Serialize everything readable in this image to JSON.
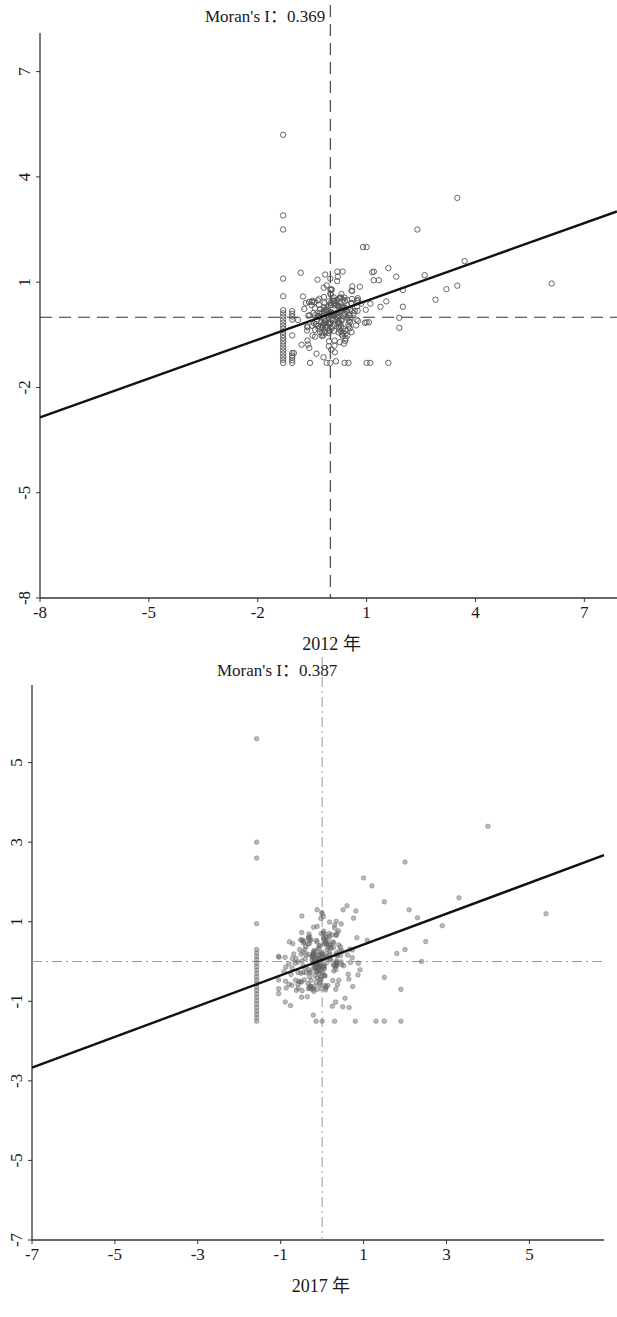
{
  "chart_data": [
    {
      "type": "scatter",
      "title": "Moran's I：0.369",
      "xlabel": "2012 年",
      "ylabel": "",
      "xlim": [
        -8,
        7.9
      ],
      "ylim": [
        -8,
        8.1
      ],
      "xticks": [
        -8,
        -5,
        -2,
        1,
        4,
        7
      ],
      "yticks": [
        -8,
        -5,
        -2,
        1,
        4,
        7
      ],
      "xtick_labels": [
        "-8",
        "-5",
        "-2",
        "1",
        "4",
        "7"
      ],
      "ytick_labels": [
        "-8",
        "-5",
        "-2",
        "1",
        "4",
        "7"
      ],
      "grid": false,
      "reference_lines": {
        "x": 0,
        "y": 0,
        "style": "dashed"
      },
      "fit_line": {
        "slope": 0.369,
        "intercept": 0.1
      },
      "marker": "hollow-circle",
      "marker_color": "#555555",
      "highlighted_points": [
        {
          "x": -1.3,
          "y": 5.2
        },
        {
          "x": -1.3,
          "y": 2.9
        },
        {
          "x": -1.3,
          "y": 2.5
        },
        {
          "x": -1.3,
          "y": 1.1
        },
        {
          "x": -1.3,
          "y": 0.6
        },
        {
          "x": 3.5,
          "y": 3.4
        },
        {
          "x": 2.4,
          "y": 2.5
        },
        {
          "x": 6.1,
          "y": 0.96
        },
        {
          "x": 0.9,
          "y": 2.0
        },
        {
          "x": 1.0,
          "y": 2.0
        },
        {
          "x": 0.0,
          "y": 1.1
        },
        {
          "x": 2.6,
          "y": 1.2
        },
        {
          "x": 3.2,
          "y": 0.8
        },
        {
          "x": 3.7,
          "y": 1.6
        },
        {
          "x": 2.9,
          "y": 0.5
        },
        {
          "x": 3.5,
          "y": 0.9
        },
        {
          "x": 1.6,
          "y": 1.4
        },
        {
          "x": 1.2,
          "y": 1.3
        },
        {
          "x": 2.0,
          "y": 0.3
        },
        {
          "x": 1.9,
          "y": -0.3
        }
      ],
      "vertical_cluster": {
        "x": -1.3,
        "y_min": -1.3,
        "y_max": 0.2,
        "count": 18
      },
      "main_cluster": {
        "x_mean": 0.1,
        "y_mean": 0.0,
        "x_sd": 0.45,
        "y_sd": 0.5,
        "count": 230
      },
      "bottom_row": {
        "y": -1.3,
        "xs": [
          -0.1,
          0.0,
          0.5,
          1.0,
          1.1,
          1.6
        ]
      }
    },
    {
      "type": "scatter",
      "title": "Moran's I：0.387",
      "xlabel": "2017 年",
      "ylabel": "",
      "xlim": [
        -7,
        6.8
      ],
      "ylim": [
        -7,
        6.95
      ],
      "xticks": [
        -7,
        -5,
        -3,
        -1,
        1,
        3,
        5
      ],
      "yticks": [
        -7,
        -5,
        -3,
        -1,
        1,
        3,
        5
      ],
      "xtick_labels": [
        "-7",
        "-5",
        "-3",
        "-1",
        "1",
        "3",
        "5"
      ],
      "ytick_labels": [
        "-7",
        "-5",
        "-3",
        "-1",
        "1",
        "3",
        "5"
      ],
      "grid": false,
      "reference_lines": {
        "x": 0,
        "y": 0,
        "style": "dash-dot"
      },
      "fit_line": {
        "slope": 0.387,
        "intercept": 0.04
      },
      "marker": "filled-translucent-circle",
      "marker_color": "#666666",
      "highlighted_points": [
        {
          "x": -1.58,
          "y": 5.6
        },
        {
          "x": -1.58,
          "y": 3.0
        },
        {
          "x": -1.58,
          "y": 2.6
        },
        {
          "x": -1.58,
          "y": 0.95
        },
        {
          "x": 4.0,
          "y": 3.4
        },
        {
          "x": 2.0,
          "y": 2.5
        },
        {
          "x": 5.4,
          "y": 1.2
        },
        {
          "x": 3.3,
          "y": 1.6
        },
        {
          "x": 1.0,
          "y": 2.1
        },
        {
          "x": 1.2,
          "y": 1.9
        },
        {
          "x": 1.5,
          "y": 1.5
        },
        {
          "x": 2.1,
          "y": 1.3
        },
        {
          "x": 2.3,
          "y": 1.1
        },
        {
          "x": 2.9,
          "y": 0.9
        },
        {
          "x": 2.5,
          "y": 0.5
        },
        {
          "x": 2.0,
          "y": 0.3
        },
        {
          "x": 1.8,
          "y": 0.2
        },
        {
          "x": 0.0,
          "y": 1.2
        },
        {
          "x": 0.6,
          "y": 1.4
        },
        {
          "x": 2.4,
          "y": 0.0
        },
        {
          "x": 1.9,
          "y": -0.7
        },
        {
          "x": 1.5,
          "y": -0.4
        }
      ],
      "vertical_cluster": {
        "x": -1.58,
        "y_min": -1.5,
        "y_max": 0.3,
        "count": 22
      },
      "main_cluster": {
        "x_mean": -0.1,
        "y_mean": 0.0,
        "x_sd": 0.35,
        "y_sd": 0.45,
        "count": 260
      },
      "bottom_row": {
        "y": -1.5,
        "xs": [
          0.0,
          0.3,
          0.8,
          1.3,
          1.5,
          1.9
        ]
      }
    }
  ]
}
